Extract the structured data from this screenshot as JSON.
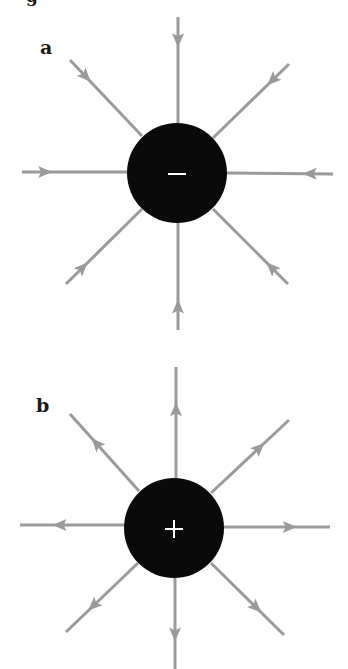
{
  "figure": {
    "cutoff_header_text": "g",
    "colors": {
      "background": "#ffffff",
      "field_line": "#9a9a9a",
      "charge_fill": "#0a0a0a",
      "charge_symbol": "#ffffff",
      "label": "#1a1a1a"
    },
    "panels": [
      {
        "id": "a",
        "label": "a",
        "charge_sign": "negative",
        "charge_symbol": "−",
        "arrow_direction": "inward",
        "center": [
          177,
          173
        ],
        "radius": 50,
        "label_position": [
          40,
          38
        ],
        "field_lines": [
          {
            "name": "top",
            "from": [
              178,
              17
            ],
            "to": [
              178,
              123
            ]
          },
          {
            "name": "top-right",
            "from": [
              289,
              64
            ],
            "to": [
              213,
              138
            ]
          },
          {
            "name": "right",
            "from": [
              333,
              174
            ],
            "to": [
              227,
              173
            ]
          },
          {
            "name": "bottom-right",
            "from": [
              288,
              284
            ],
            "to": [
              213,
              209
            ]
          },
          {
            "name": "bottom",
            "from": [
              178,
              330
            ],
            "to": [
              178,
              223
            ]
          },
          {
            "name": "bottom-left",
            "from": [
              66,
              284
            ],
            "to": [
              142,
              209
            ]
          },
          {
            "name": "left",
            "from": [
              22,
              172
            ],
            "to": [
              127,
              172
            ]
          },
          {
            "name": "top-left",
            "from": [
              70,
              60
            ],
            "to": [
              142,
              136
            ]
          }
        ]
      },
      {
        "id": "b",
        "label": "b",
        "charge_sign": "positive",
        "charge_symbol": "+",
        "arrow_direction": "outward",
        "center": [
          174,
          528
        ],
        "radius": 50,
        "label_position": [
          36,
          396
        ],
        "field_lines": [
          {
            "name": "top",
            "from": [
              176,
              478
            ],
            "to": [
              176,
              367
            ]
          },
          {
            "name": "top-right",
            "from": [
              211,
              493
            ],
            "to": [
              289,
              420
            ]
          },
          {
            "name": "right",
            "from": [
              224,
              527
            ],
            "to": [
              330,
              527
            ]
          },
          {
            "name": "bottom-right",
            "from": [
              211,
              563
            ],
            "to": [
              284,
              635
            ]
          },
          {
            "name": "bottom",
            "from": [
              175,
              578
            ],
            "to": [
              175,
              669
            ]
          },
          {
            "name": "bottom-left",
            "from": [
              138,
              563
            ],
            "to": [
              66,
              632
            ]
          },
          {
            "name": "left",
            "from": [
              124,
              525
            ],
            "to": [
              20,
              525
            ]
          },
          {
            "name": "top-left",
            "from": [
              139,
              491
            ],
            "to": [
              70,
              414
            ]
          }
        ]
      }
    ]
  }
}
